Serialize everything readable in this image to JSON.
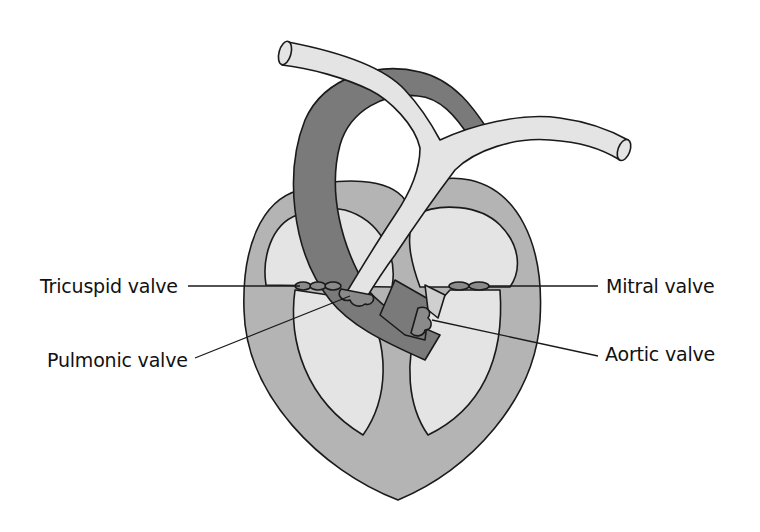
{
  "diagram": {
    "labels": {
      "tricuspid": "Tricuspid valve",
      "pulmonic": "Pulmonic valve",
      "mitral": "Mitral valve",
      "aortic": "Aortic valve"
    },
    "colors": {
      "background": "#ffffff",
      "myocardium": "#b4b4b4",
      "chambers": "#e4e4e4",
      "aorta": "#7a7a7a",
      "pulmonary_artery": "#e4e4e4",
      "valve_leaflets": "#8a8a8a",
      "outline": "#1a1a1a",
      "label_text": "#111111"
    }
  }
}
